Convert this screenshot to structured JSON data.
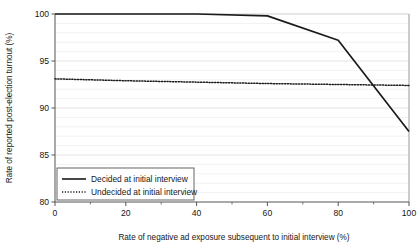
{
  "chart_data": {
    "type": "line",
    "title": "",
    "xlabel": "Rate of negative ad exposure subsequent to initial interview (%)",
    "ylabel": "Rate of reported post-election turnout (%)",
    "xlim": [
      0,
      100
    ],
    "ylim": [
      80,
      100
    ],
    "xticks": [
      0,
      20,
      40,
      60,
      80,
      100
    ],
    "xtick_labels": [
      "0",
      "20",
      "40",
      "60",
      "80",
      "100"
    ],
    "xminor_ticks": [
      10,
      30,
      50,
      70,
      90
    ],
    "yticks": [
      80,
      85,
      90,
      95,
      100
    ],
    "ytick_labels": [
      "80",
      "85",
      "90",
      "95",
      "100"
    ],
    "grid": "horizontal-minor-every-1-unit",
    "grid_color": "#e8e8e8",
    "legend_position": "lower-left-inside",
    "series": [
      {
        "name": "Decided at initial interview",
        "style": "solid",
        "color": "#1a1a1a",
        "x": [
          0,
          20,
          40,
          60,
          80,
          100
        ],
        "values": [
          100,
          100,
          100,
          99.8,
          97.2,
          87.5
        ]
      },
      {
        "name": "Undecided at initial interview",
        "style": "dotted",
        "color": "#1a1a1a",
        "x": [
          0,
          20,
          40,
          60,
          80,
          100
        ],
        "values": [
          93.1,
          92.9,
          92.75,
          92.6,
          92.5,
          92.4
        ]
      }
    ]
  },
  "legend": {
    "entries": [
      {
        "label": "Decided at initial interview"
      },
      {
        "label": "Undecided at initial interview"
      }
    ]
  }
}
